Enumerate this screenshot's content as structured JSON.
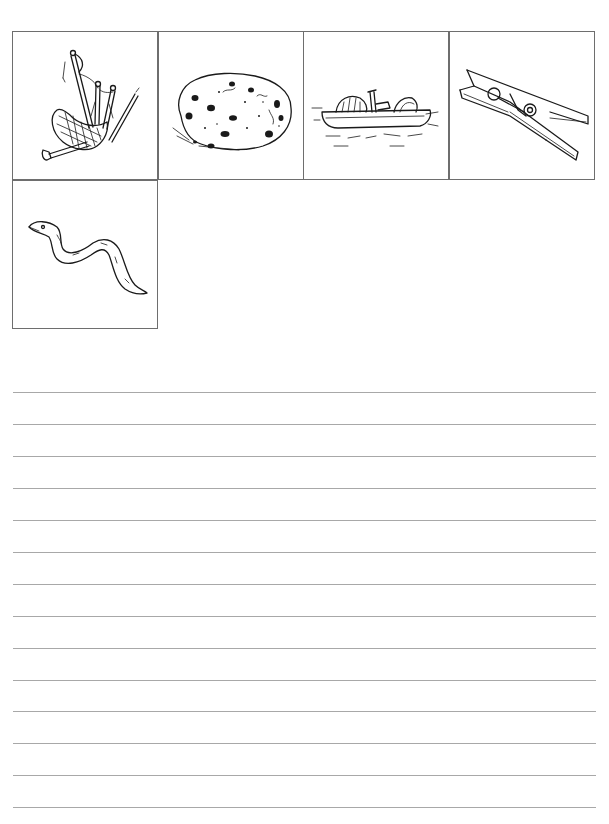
{
  "worksheet": {
    "picture_cards": [
      {
        "row": 0,
        "col": 0,
        "icon": "bagpipes-icon",
        "label": "bagpipes"
      },
      {
        "row": 0,
        "col": 1,
        "icon": "cookie-icon",
        "label": "cookie"
      },
      {
        "row": 0,
        "col": 2,
        "icon": "pedal-boat-icon",
        "label": "pedal boat"
      },
      {
        "row": 0,
        "col": 3,
        "icon": "clothespin-icon",
        "label": "clothespin"
      },
      {
        "row": 1,
        "col": 0,
        "icon": "eel-icon",
        "label": "eel"
      }
    ],
    "writing_lines": {
      "count": 14,
      "first_y": 392,
      "spacing": 32,
      "color": "#a8a8a8"
    },
    "border_color": "#6e6e6e"
  }
}
